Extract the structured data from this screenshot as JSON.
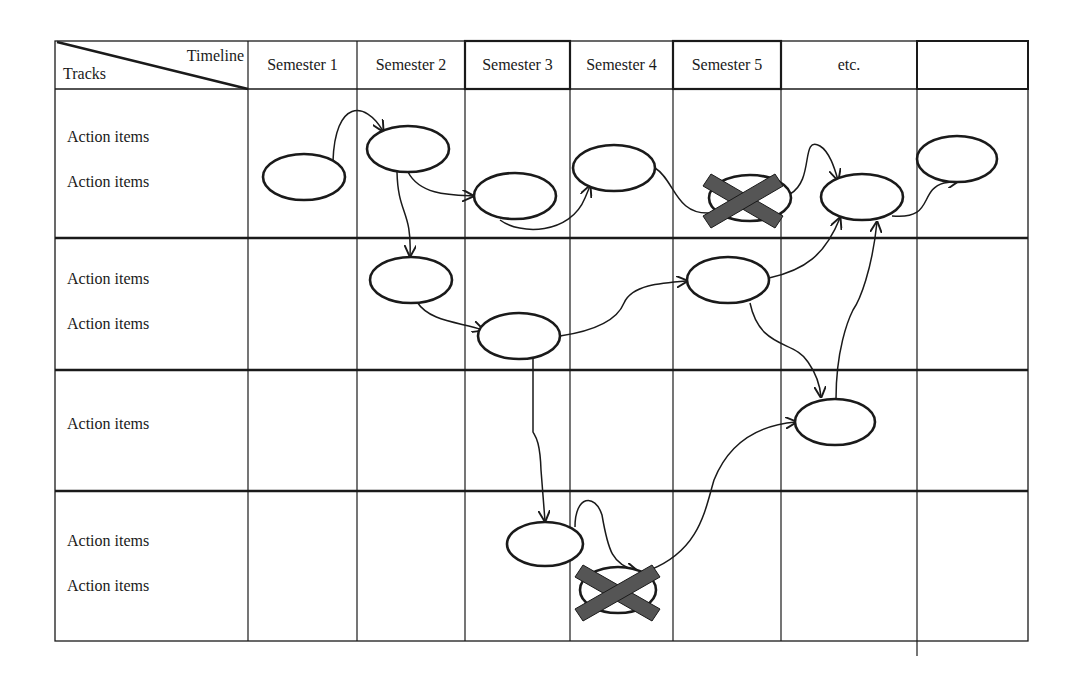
{
  "header": {
    "corner_top": "Timeline",
    "corner_bottom": "Tracks",
    "columns": [
      "Semester 1",
      "Semester 2",
      "Semester 3",
      "Semester 4",
      "Semester 5",
      "etc.",
      ""
    ]
  },
  "tracks": [
    {
      "labels": [
        "Action items",
        "Action items"
      ]
    },
    {
      "labels": [
        "Action items",
        "Action items"
      ]
    },
    {
      "labels": [
        "Action items"
      ]
    },
    {
      "labels": [
        "Action items",
        "Action items"
      ]
    }
  ],
  "colors": {
    "line": "#1a1a1a",
    "cross": "#555555",
    "background": "#ffffff"
  },
  "nodes": [
    {
      "id": "t1-s1",
      "track": 1,
      "column": "Semester 1",
      "cancelled": false
    },
    {
      "id": "t1-s2",
      "track": 1,
      "column": "Semester 2",
      "cancelled": false
    },
    {
      "id": "t1-s3",
      "track": 1,
      "column": "Semester 3",
      "cancelled": false
    },
    {
      "id": "t1-s4",
      "track": 1,
      "column": "Semester 4",
      "cancelled": false
    },
    {
      "id": "t1-s5",
      "track": 1,
      "column": "Semester 5",
      "cancelled": true
    },
    {
      "id": "t1-etc",
      "track": 1,
      "column": "etc.",
      "cancelled": false
    },
    {
      "id": "t1-last",
      "track": 1,
      "column": "",
      "cancelled": false
    },
    {
      "id": "t2-s2",
      "track": 2,
      "column": "Semester 2",
      "cancelled": false
    },
    {
      "id": "t2-s3",
      "track": 2,
      "column": "Semester 3",
      "cancelled": false
    },
    {
      "id": "t2-s5",
      "track": 2,
      "column": "Semester 5",
      "cancelled": false
    },
    {
      "id": "t3-etc",
      "track": 3,
      "column": "etc.",
      "cancelled": false
    },
    {
      "id": "t4-s3",
      "track": 4,
      "column": "Semester 3",
      "cancelled": false
    },
    {
      "id": "t4-s4",
      "track": 4,
      "column": "Semester 4",
      "cancelled": true
    }
  ]
}
